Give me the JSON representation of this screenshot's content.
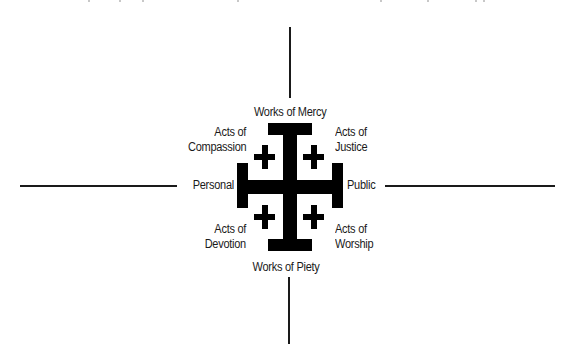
{
  "diagram": {
    "type": "jerusalem-cross-quadrant",
    "axes": {
      "top": "Works of Mercy",
      "bottom": "Works of Piety",
      "left": "Personal",
      "right": "Public"
    },
    "quadrants": {
      "top_left": [
        "Acts of",
        "Compassion"
      ],
      "top_right": [
        "Acts of",
        "Justice"
      ],
      "bottom_left": [
        "Acts of",
        "Devotion"
      ],
      "bottom_right": [
        "Acts of",
        "Worship"
      ]
    },
    "colors": {
      "background": "#ffffff",
      "cross": "#000000",
      "lines": "#1a1a1a",
      "text": "#1a1a1a"
    }
  }
}
